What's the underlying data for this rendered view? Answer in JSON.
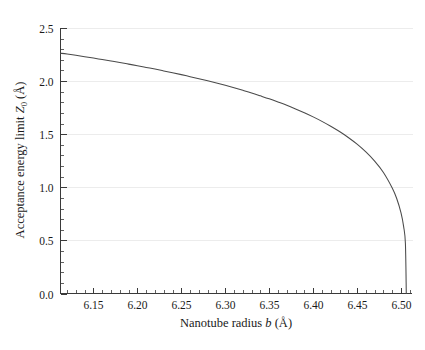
{
  "figure": {
    "background_color": "#ffffff",
    "curve_color": "#4a4a4a",
    "grid_color": "#ececec",
    "axis_color": "#3a3a3a"
  },
  "chart_data": {
    "type": "line",
    "title": "",
    "xlabel_text": "Nanotube radius b (Å)",
    "xlabel_prefix": "Nanotube radius ",
    "xlabel_symbol": "b",
    "xlabel_unit": " (Å)",
    "ylabel_text": "Acceptance energy limit Z0 (Å)",
    "ylabel_prefix": "Acceptance energy limit ",
    "ylabel_symbol": "Z",
    "ylabel_subscript": "0",
    "ylabel_unit": " (Å)",
    "xlim": [
      6.1125,
      6.5125
    ],
    "ylim": [
      0.0,
      2.5
    ],
    "xticks": [
      6.15,
      6.2,
      6.25,
      6.3,
      6.35,
      6.4,
      6.45,
      6.5
    ],
    "xtick_labels": [
      "6.15",
      "6.20",
      "6.25",
      "6.30",
      "6.35",
      "6.40",
      "6.45",
      "6.50"
    ],
    "xtick_minor_step": 0.01,
    "yticks": [
      0.0,
      0.5,
      1.0,
      1.5,
      2.0,
      2.5
    ],
    "ytick_labels": [
      "0.0",
      "0.5",
      "1.0",
      "1.5",
      "2.0",
      "2.5"
    ],
    "ytick_minor_step": 0.1,
    "grid": true,
    "grid_axis": "y",
    "legend": false,
    "legend_position": "none",
    "series": [
      {
        "name": "Acceptance energy limit",
        "x": [
          6.1125,
          6.12,
          6.13,
          6.14,
          6.15,
          6.16,
          6.17,
          6.18,
          6.19,
          6.2,
          6.21,
          6.22,
          6.23,
          6.24,
          6.25,
          6.26,
          6.27,
          6.28,
          6.29,
          6.3,
          6.31,
          6.32,
          6.33,
          6.34,
          6.35,
          6.36,
          6.37,
          6.38,
          6.39,
          6.4,
          6.41,
          6.42,
          6.43,
          6.44,
          6.45,
          6.46,
          6.47,
          6.48,
          6.49,
          6.495,
          6.5,
          6.503,
          6.505,
          6.506
        ],
        "y": [
          2.262,
          2.255,
          2.243,
          2.23,
          2.217,
          2.203,
          2.189,
          2.175,
          2.16,
          2.145,
          2.129,
          2.113,
          2.096,
          2.079,
          2.061,
          2.042,
          2.023,
          2.003,
          1.982,
          1.96,
          1.937,
          1.913,
          1.888,
          1.861,
          1.833,
          1.803,
          1.772,
          1.738,
          1.702,
          1.663,
          1.621,
          1.575,
          1.525,
          1.469,
          1.406,
          1.333,
          1.247,
          1.14,
          0.994,
          0.897,
          0.76,
          0.63,
          0.47,
          0.0
        ]
      }
    ]
  }
}
